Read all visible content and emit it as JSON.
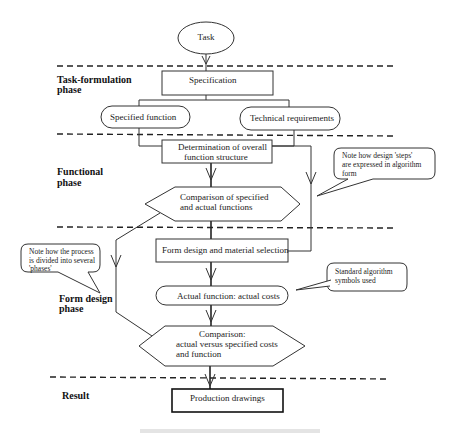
{
  "diagram": {
    "phases": [
      {
        "id": "task-formulation",
        "label_line1": "Task-formulation",
        "label_line2": "phase"
      },
      {
        "id": "functional",
        "label_line1": "Functional",
        "label_line2": "phase"
      },
      {
        "id": "form-design",
        "label_line1": "Form design",
        "label_line2": "phase"
      },
      {
        "id": "result",
        "label_line1": "Result",
        "label_line2": ""
      }
    ],
    "nodes": {
      "task": {
        "shape": "ellipse",
        "label": "Task"
      },
      "specification": {
        "shape": "rectangle",
        "label": "Specification"
      },
      "specified_function": {
        "shape": "rounded",
        "label": "Specified function"
      },
      "technical_requirements": {
        "shape": "rounded",
        "label": "Technical requirements"
      },
      "determination": {
        "shape": "rectangle",
        "label_line1": "Determination of overall",
        "label_line2": "function structure"
      },
      "comparison1": {
        "shape": "hexagon",
        "label_line1": "Comparison of specified",
        "label_line2": "and actual functions"
      },
      "form_design": {
        "shape": "rectangle",
        "label": "Form design and material  selection"
      },
      "actual_function": {
        "shape": "rounded",
        "label": "Actual function: actual costs"
      },
      "comparison2": {
        "shape": "hexagon",
        "label_line1": "Comparison:",
        "label_line2": "actual versus specified costs",
        "label_line3": "and function"
      },
      "production_drawings": {
        "shape": "rectangle",
        "label": "Production drawings"
      }
    },
    "callouts": {
      "steps": {
        "line1": "Note how design 'steps'",
        "line2": "are expressed in algorithm",
        "line3": "form"
      },
      "phases": {
        "line1": "Note how the process",
        "line2": "is divided into several",
        "line3": "'phases'"
      },
      "symbols": {
        "line1": "Standard algorithm",
        "line2": "symbols used"
      }
    },
    "colors": {
      "line": "#333333",
      "background": "#ffffff",
      "text": "#222222"
    }
  }
}
